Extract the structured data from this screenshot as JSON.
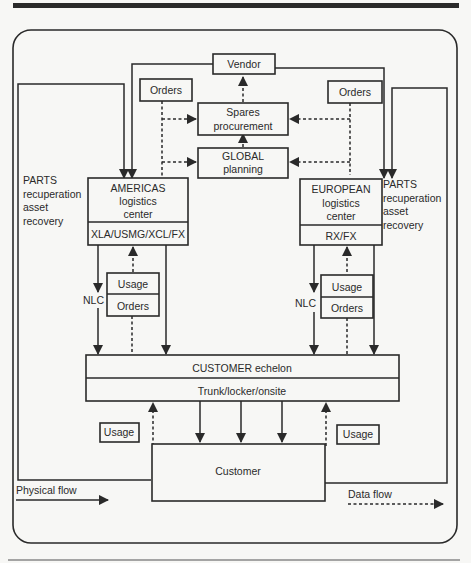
{
  "diagram": {
    "title": "",
    "nodes": {
      "vendor": "Vendor",
      "orders_left": "Orders",
      "orders_right": "Orders",
      "spares_1": "Spares",
      "spares_2": "procurement",
      "global_1": "GLOBAL",
      "global_2": "planning",
      "americas_1": "AMERICAS",
      "americas_2": "logistics",
      "americas_3": "center",
      "americas_sub": "XLA/USMG/XCL/FX",
      "european_1": "EUROPEAN",
      "european_2": "logistics",
      "european_3": "center",
      "european_sub": "RX/FX",
      "usage_left": "Usage",
      "orders_mid_left": "Orders",
      "usage_right": "Usage",
      "orders_mid_right": "Orders",
      "customer_echelon": "CUSTOMER echelon",
      "customer_echelon_sub": "Trunk/locker/onsite",
      "usage_bottom_left": "Usage",
      "usage_bottom_right": "Usage",
      "customer": "Customer"
    },
    "labels": {
      "parts_left": [
        "PARTS",
        "recuperation",
        "asset",
        "recovery"
      ],
      "parts_right": [
        "PARTS",
        "recuperation",
        "asset",
        "recovery"
      ],
      "nlc_left": "NLC",
      "nlc_right": "NLC"
    },
    "legend": {
      "physical": "Physical flow",
      "data": "Data flow"
    }
  }
}
